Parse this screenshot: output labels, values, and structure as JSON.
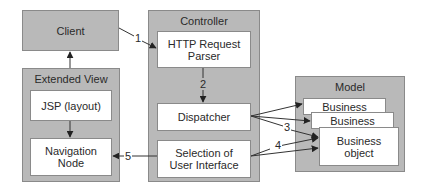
{
  "diagram": {
    "nodes": {
      "client": {
        "label": "Client"
      },
      "extended_view": {
        "title": "Extended View",
        "children": {
          "jsp": {
            "label": "JSP (layout)"
          },
          "navigation_node": {
            "line1": "Navigation",
            "line2": "Node"
          }
        }
      },
      "controller": {
        "title": "Controller",
        "children": {
          "http_parser": {
            "line1": "HTTP Request",
            "line2": "Parser"
          },
          "dispatcher": {
            "label": "Dispatcher"
          },
          "selection_ui": {
            "line1": "Selection of",
            "line2": "User Interface"
          }
        }
      },
      "model": {
        "title": "Model",
        "children": {
          "business1": {
            "label": "Business"
          },
          "business2": {
            "label": "Business"
          },
          "business_object": {
            "line1": "Business",
            "line2": "object"
          }
        }
      }
    },
    "edges": [
      {
        "from": "client",
        "to": "http_parser",
        "label": "1"
      },
      {
        "from": "http_parser",
        "to": "dispatcher",
        "label": "2"
      },
      {
        "from": "dispatcher",
        "to": "business_objects",
        "label": "3"
      },
      {
        "from": "selection_ui",
        "to": "business_objects",
        "label": "4"
      },
      {
        "from": "selection_ui",
        "to": "navigation_node",
        "label": "5"
      },
      {
        "from": "jsp",
        "to": "navigation_node",
        "label": ""
      },
      {
        "from": "extended_view",
        "to": "client",
        "label": ""
      }
    ],
    "colors": {
      "container_fill": "#b9b9b9",
      "container_border": "#8a8a8a",
      "box_fill": "#ffffff",
      "arrow": "#333333"
    }
  }
}
